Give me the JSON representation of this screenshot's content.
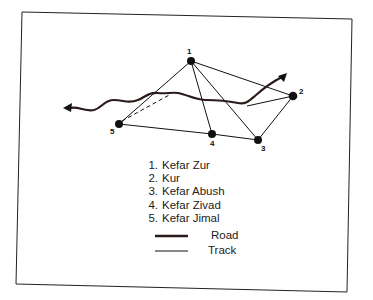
{
  "diagram": {
    "type": "network-map",
    "nodes": [
      {
        "id": "1",
        "name": "Kefar Zur",
        "x": 191,
        "y": 61
      },
      {
        "id": "2",
        "name": "Kur",
        "x": 293,
        "y": 96
      },
      {
        "id": "3",
        "name": "Kefar Abush",
        "x": 258,
        "y": 140
      },
      {
        "id": "4",
        "name": "Kefar Zivad",
        "x": 212,
        "y": 134
      },
      {
        "id": "5",
        "name": "Kefar Jimal",
        "x": 119,
        "y": 124
      }
    ],
    "tracks": [
      [
        "1",
        "2"
      ],
      [
        "1",
        "3"
      ],
      [
        "1",
        "4"
      ],
      [
        "1",
        "5"
      ],
      [
        "2",
        "3"
      ],
      [
        "3",
        "4"
      ],
      [
        "4",
        "5"
      ]
    ],
    "dashed_tracks": [
      [
        "5",
        "road-midpoint"
      ]
    ],
    "road": {
      "description": "wavy road running west to east with arrowheads at both ends, branching toward node 2 and northeast"
    }
  },
  "legend": {
    "places": [
      {
        "num": "1.",
        "name": "Kefar Zur"
      },
      {
        "num": "2.",
        "name": "Kur"
      },
      {
        "num": "3.",
        "name": "Kefar Abush"
      },
      {
        "num": "4.",
        "name": "Kefar Zivad"
      },
      {
        "num": "5.",
        "name": "Kefar Jimal"
      }
    ],
    "road_label": "Road",
    "track_label": "Track"
  },
  "labels": {
    "n1": "1",
    "n2": "2",
    "n3": "3",
    "n4": "4",
    "n5": "5"
  }
}
